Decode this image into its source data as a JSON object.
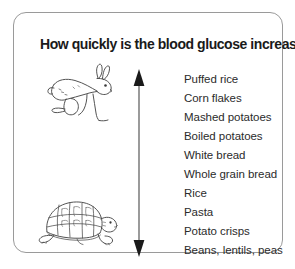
{
  "panel": {
    "title": "How quickly is the blood glucose increased?",
    "border_color": "#9a9a9a",
    "background_color": "#ffffff"
  },
  "illustrations": [
    {
      "name": "hare",
      "label": "hare",
      "meaning": "fast"
    },
    {
      "name": "tortoise",
      "label": "tortoise",
      "meaning": "slow"
    }
  ],
  "arrow": {
    "name": "double-headed-vertical-arrow",
    "direction": "up-down",
    "color": "#1a1a1a",
    "top_meaning": "fastest",
    "bottom_meaning": "slowest"
  },
  "food_list": {
    "items": [
      "Puffed rice",
      "Corn flakes",
      "Mashed potatoes",
      "Boiled potatoes",
      "White bread",
      "Whole grain bread",
      "Rice",
      "Pasta",
      "Potato crisps",
      "Beans, lentils, peas"
    ],
    "text_color": "#2b2b2b"
  }
}
